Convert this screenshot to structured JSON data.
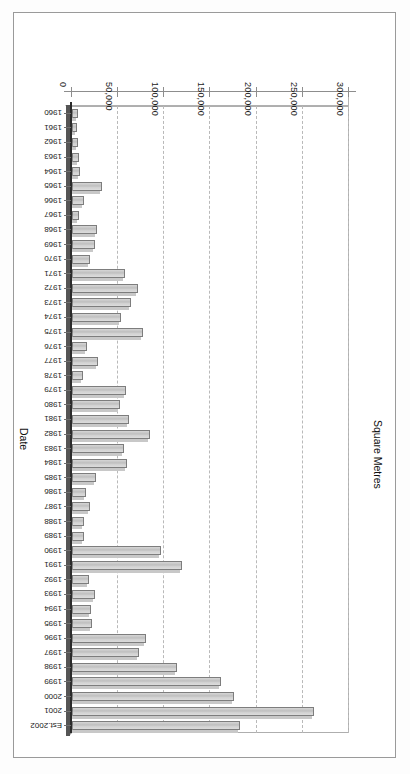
{
  "chart_data": {
    "type": "bar",
    "orientation": "horizontal",
    "title": "",
    "xlabel": "Square Metres",
    "ylabel": "Date",
    "xlim": [
      0,
      300000
    ],
    "grid": true,
    "legend": false,
    "tick_labels": [
      "0",
      "50,000",
      "100,000",
      "150,000",
      "200,000",
      "250,000",
      "300,000"
    ],
    "tick_values": [
      0,
      50000,
      100000,
      150000,
      200000,
      250000,
      300000
    ],
    "categories": [
      "1960",
      "1961",
      "1962",
      "1963",
      "1964",
      "1965",
      "1966",
      "1967",
      "1968",
      "1969",
      "1970",
      "1971",
      "1972",
      "1973",
      "1974",
      "1975",
      "1976",
      "1977",
      "1978",
      "1979",
      "1980",
      "1981",
      "1982",
      "1983",
      "1984",
      "1985",
      "1986",
      "1987",
      "1988",
      "1989",
      "1990",
      "1991",
      "1992",
      "1993",
      "1994",
      "1995",
      "1996",
      "1997",
      "1998",
      "1999",
      "2000",
      "2001",
      "Est.2002"
    ],
    "values": [
      6000,
      5000,
      7000,
      8000,
      9000,
      33000,
      13000,
      8000,
      27000,
      25000,
      19000,
      57000,
      72000,
      64000,
      53000,
      77000,
      16000,
      28000,
      12000,
      58000,
      52000,
      62000,
      84000,
      56000,
      60000,
      26000,
      15000,
      20000,
      13000,
      13000,
      96000,
      119000,
      18000,
      25000,
      21000,
      22000,
      80000,
      73000,
      114000,
      161000,
      175000,
      262000,
      182000
    ]
  },
  "axes": {
    "value_axis_title": "Square Metres",
    "category_axis_title": "Date"
  },
  "figure": {
    "background": "#ffffff",
    "bar_fill": "#cfcfcf",
    "bar_edge": "#7d7d7d",
    "gridline_color": "#b9b9b9",
    "axis_color": "#8d8d8d",
    "rotation_degrees": "180"
  }
}
